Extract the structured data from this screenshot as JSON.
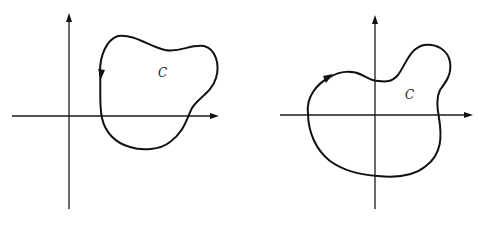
{
  "figure": {
    "panels": [
      {
        "id": "left",
        "curve_label": "C",
        "orientation": "counterclockwise",
        "encloses_origin": false
      },
      {
        "id": "right",
        "curve_label": "C",
        "orientation": "clockwise",
        "encloses_origin": true
      }
    ]
  },
  "colors": {
    "ink": "#111111",
    "background": "#ffffff"
  }
}
